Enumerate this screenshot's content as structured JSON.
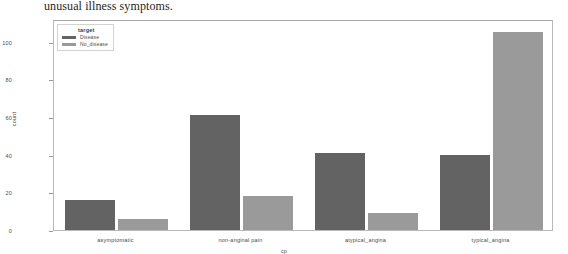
{
  "document": {
    "text_line": "unusual illness symptoms."
  },
  "chart_data": {
    "type": "bar",
    "title": "",
    "xlabel": "cp",
    "ylabel": "count",
    "categories": [
      "asymptomatic",
      "non-anginal pain",
      "atypical_angina",
      "typical_angina"
    ],
    "series": [
      {
        "name": "Disease",
        "values": [
          16,
          61,
          41,
          40
        ],
        "color": "#636363"
      },
      {
        "name": "No_disease",
        "values": [
          6,
          18,
          9,
          105
        ],
        "color": "#9a9a9a"
      }
    ],
    "legend_title": "target",
    "legend_position": "upper left",
    "ylim": [
      0,
      112
    ],
    "yticks": [
      0,
      20,
      40,
      60,
      80,
      100
    ],
    "grid": false
  },
  "axis": {
    "y_ticks": [
      "0",
      "20",
      "40",
      "60",
      "80",
      "100"
    ],
    "x_ticks": [
      "asymptomatic",
      "non-anginal pain",
      "atypical_angina",
      "typical_angina"
    ],
    "y_title": "count",
    "x_title": "cp"
  },
  "legend": {
    "title": "target",
    "entries": [
      {
        "label": "Disease",
        "color": "#636363"
      },
      {
        "label": "No_disease",
        "color": "#9a9a9a"
      }
    ]
  }
}
